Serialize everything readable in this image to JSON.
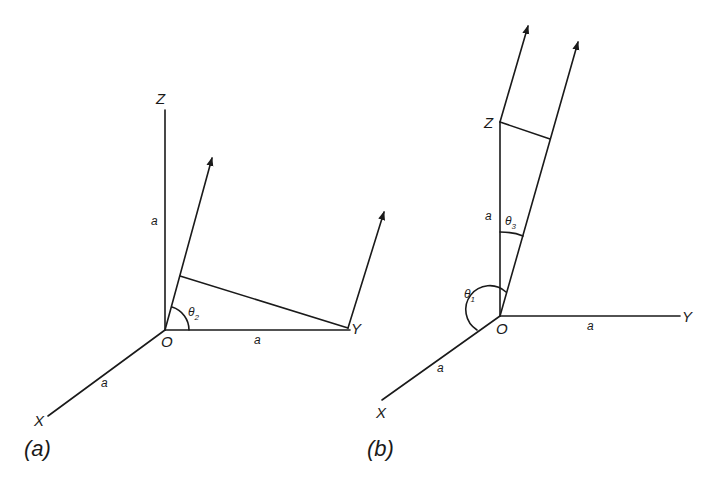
{
  "figure": {
    "panel_a": {
      "caption": "(a)",
      "labels": {
        "z_axis": "Z",
        "y_axis": "Y",
        "x_axis": "X",
        "origin": "O",
        "len_oz": "a",
        "len_oy": "a",
        "len_ox": "a",
        "angle": "θ",
        "angle_sub": "2"
      }
    },
    "panel_b": {
      "caption": "(b)",
      "labels": {
        "z_axis": "Z",
        "y_axis": "Y",
        "x_axis": "X",
        "origin": "O",
        "len_oz": "a",
        "len_oy": "a",
        "len_ox": "a",
        "angle1": "θ",
        "angle1_sub": "1",
        "angle3": "θ",
        "angle3_sub": "3"
      }
    },
    "colors": {
      "line": "#1a1a1a",
      "background": "#ffffff"
    }
  }
}
